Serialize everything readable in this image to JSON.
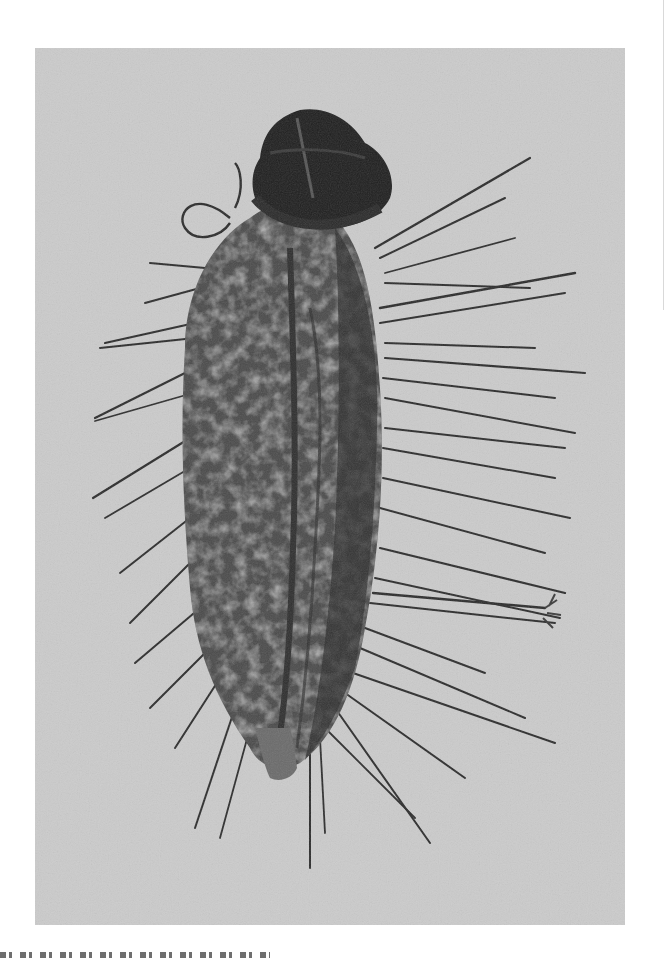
{
  "figure": {
    "background_color": "#cbcbcb",
    "body_color": "#3a3a3a",
    "head_color": "#1e1e1e",
    "bristle_color": "#2a2a2a"
  },
  "caption": {
    "text": "",
    "clipped": true
  }
}
